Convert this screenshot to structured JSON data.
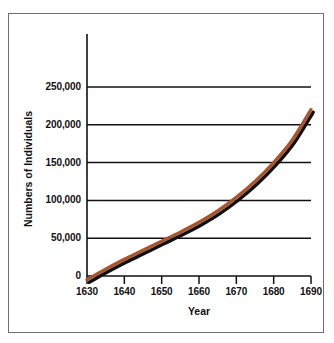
{
  "chart_data": {
    "type": "line",
    "title": "",
    "xlabel": "Year",
    "ylabel": "Numbers of Individuals",
    "xlim": [
      1630,
      1690
    ],
    "ylim": [
      0,
      250000
    ],
    "grid": true,
    "legend": "none",
    "x_ticks": [
      "1630",
      "1640",
      "1650",
      "1660",
      "1670",
      "1680",
      "1690"
    ],
    "x_tick_values": [
      1630,
      1640,
      1650,
      1660,
      1670,
      1680,
      1690
    ],
    "y_ticks": [
      "0",
      "50,000",
      "100,000",
      "150,000",
      "200,000",
      "250,000"
    ],
    "y_tick_values": [
      0,
      50000,
      100000,
      150000,
      200000,
      250000
    ],
    "series": [
      {
        "name": "Population",
        "color": "#A8552F",
        "shadow_color": "#111114",
        "x": [
          1630,
          1635,
          1640,
          1645,
          1650,
          1655,
          1660,
          1665,
          1670,
          1675,
          1680,
          1685,
          1690
        ],
        "values": [
          -5000,
          9000,
          22000,
          34000,
          46000,
          58000,
          71000,
          86000,
          104000,
          125000,
          150000,
          180000,
          220000
        ]
      }
    ]
  },
  "axes": {
    "y_title": "Numbers of Individuals",
    "x_title": "Year"
  }
}
